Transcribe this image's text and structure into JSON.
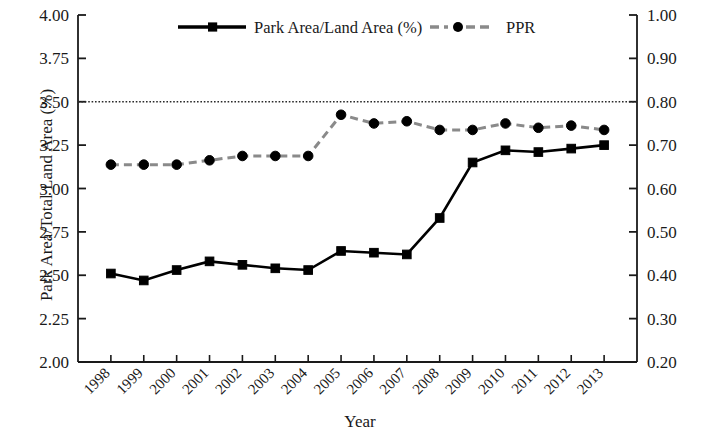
{
  "chart_data": {
    "type": "line",
    "title": "",
    "xlabel": "Year",
    "ylabel": "Park Area/Total Land Area (%)",
    "ylabel_right": "Park Provision Ratio (PPR) (ha/1000 person)",
    "categories": [
      "1998",
      "1999",
      "2000",
      "2001",
      "2002",
      "2003",
      "2004",
      "2005",
      "2006",
      "2007",
      "2008",
      "2009",
      "2010",
      "2011",
      "2012",
      "2013"
    ],
    "ylim": [
      2.0,
      4.0
    ],
    "ylim_right": [
      0.2,
      1.0
    ],
    "yticks": [
      "2.00",
      "2.25",
      "2.50",
      "2.75",
      "3.00",
      "3.25",
      "3.50",
      "3.75",
      "4.00"
    ],
    "yticks_right": [
      "0.20",
      "0.30",
      "0.40",
      "0.50",
      "0.60",
      "0.70",
      "0.80",
      "0.90",
      "1.00"
    ],
    "grid": false,
    "legend_position": "top-inside",
    "annotations": [
      {
        "type": "hline",
        "axis": "left",
        "value": 3.5,
        "axis_right_value": 0.8,
        "style": "dotted"
      }
    ],
    "series": [
      {
        "name": "Park Area/Land Area (%)",
        "axis": "left",
        "marker": "square",
        "linestyle": "solid",
        "color": "#000000",
        "values": [
          2.51,
          2.47,
          2.53,
          2.58,
          2.56,
          2.54,
          2.53,
          2.64,
          2.63,
          2.62,
          2.83,
          3.15,
          3.22,
          3.21,
          3.23,
          3.25
        ]
      },
      {
        "name": "PPR",
        "axis": "right",
        "marker": "circle",
        "linestyle": "dashed",
        "color": "#8a8a8a",
        "values": [
          0.655,
          0.655,
          0.655,
          0.665,
          0.675,
          0.675,
          0.675,
          0.77,
          0.75,
          0.755,
          0.735,
          0.735,
          0.75,
          0.74,
          0.745,
          0.735
        ]
      }
    ]
  },
  "legend": {
    "items": [
      {
        "label": "Park Area/Land Area (%)",
        "marker": "square",
        "linestyle": "solid",
        "color": "#000000"
      },
      {
        "label": "PPR",
        "marker": "circle",
        "linestyle": "dashed",
        "color": "#8a8a8a"
      }
    ]
  },
  "axes": {
    "left_title": "Park Area/Total Land Area (%)",
    "right_title": "Park Provision Ratio (PPR) (ha/1000 person)",
    "bottom_title": "Year"
  }
}
